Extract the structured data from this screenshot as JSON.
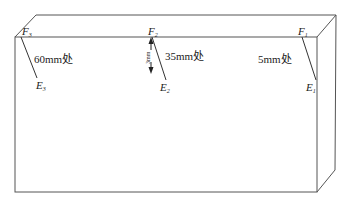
{
  "diagram": {
    "type": "3d-block-with-crack-paths",
    "line_color": "#555555",
    "points": [
      {
        "top": "F",
        "top_sub": "3",
        "bottom": "E",
        "bottom_sub": "3",
        "position_label": "60mm处"
      },
      {
        "top": "F",
        "top_sub": "2",
        "bottom": "E",
        "bottom_sub": "2",
        "position_label": "35mm处",
        "depth_label": "3mm"
      },
      {
        "top": "F",
        "top_sub": "1",
        "bottom": "E",
        "bottom_sub": "1",
        "position_label": "5mm处"
      }
    ]
  }
}
